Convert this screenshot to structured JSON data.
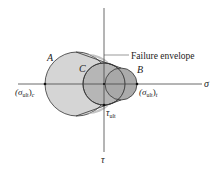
{
  "diagram": {
    "title": "Failure envelope",
    "axes": {
      "x_label": "σ",
      "y_label": "τ"
    },
    "labels": {
      "circle_a": "A",
      "circle_b": "B",
      "circle_c": "C",
      "envelope": "Failure envelope",
      "sigma_ult_c": "(σ",
      "sigma_ult_c_sub": "ult",
      "sigma_ult_c_close": ")",
      "sigma_ult_c_suffix": "c",
      "sigma_ult_t": "(σ",
      "sigma_ult_t_sub": "ult",
      "sigma_ult_t_close": ")",
      "sigma_ult_t_suffix": "t",
      "tau_ult": "τ",
      "tau_ult_sub": "ult"
    },
    "colors": {
      "circle_a_fill": "#d5d5d5",
      "circle_c_fill": "#b6b6b6",
      "circle_b_fill": "#a3a3a3",
      "envelope_fill": "#c4c4c4",
      "stroke": "#333333",
      "axis": "#444444"
    }
  }
}
